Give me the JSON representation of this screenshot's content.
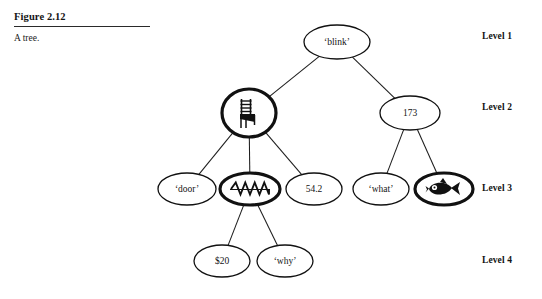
{
  "figure": {
    "number": "Figure 2.12",
    "caption": "A tree."
  },
  "levels": [
    {
      "label": "Level 1",
      "x": 482,
      "y": 31
    },
    {
      "label": "Level 2",
      "x": 482,
      "y": 102
    },
    {
      "label": "Level 3",
      "x": 482,
      "y": 183
    },
    {
      "label": "Level 4",
      "x": 482,
      "y": 255
    }
  ],
  "tree": {
    "nodes": [
      {
        "id": "blink",
        "label": "‘blink’",
        "kind": "text",
        "level": 1,
        "cx": 337,
        "cy": 42,
        "rx": 33,
        "ry": 17,
        "thick": false
      },
      {
        "id": "chair",
        "label": "",
        "kind": "chair",
        "level": 2,
        "cx": 249,
        "cy": 113,
        "rx": 27,
        "ry": 24,
        "thick": true
      },
      {
        "id": "173",
        "label": "173",
        "kind": "text",
        "level": 2,
        "cx": 410,
        "cy": 113,
        "rx": 30,
        "ry": 17,
        "thick": false
      },
      {
        "id": "door",
        "label": "‘door’",
        "kind": "text",
        "level": 3,
        "cx": 187,
        "cy": 189,
        "rx": 29,
        "ry": 16,
        "thick": false
      },
      {
        "id": "zigzag",
        "label": "",
        "kind": "zigzag",
        "level": 3,
        "cx": 250,
        "cy": 189,
        "rx": 30,
        "ry": 16,
        "thick": true
      },
      {
        "id": "542",
        "label": "54.2",
        "kind": "text",
        "level": 3,
        "cx": 314,
        "cy": 189,
        "rx": 28,
        "ry": 16,
        "thick": false
      },
      {
        "id": "what",
        "label": "‘what’",
        "kind": "text",
        "level": 3,
        "cx": 381,
        "cy": 189,
        "rx": 28,
        "ry": 16,
        "thick": false
      },
      {
        "id": "fish",
        "label": "",
        "kind": "fish",
        "level": 3,
        "cx": 444,
        "cy": 189,
        "rx": 29,
        "ry": 16,
        "thick": true
      },
      {
        "id": "20",
        "label": "$20",
        "kind": "text",
        "level": 4,
        "cx": 222,
        "cy": 261,
        "rx": 28,
        "ry": 16,
        "thick": false
      },
      {
        "id": "why",
        "label": "‘why’",
        "kind": "text",
        "level": 4,
        "cx": 285,
        "cy": 261,
        "rx": 28,
        "ry": 16,
        "thick": false
      }
    ],
    "edges": [
      {
        "from": "blink",
        "to": "chair"
      },
      {
        "from": "blink",
        "to": "173"
      },
      {
        "from": "chair",
        "to": "door"
      },
      {
        "from": "chair",
        "to": "zigzag"
      },
      {
        "from": "chair",
        "to": "542"
      },
      {
        "from": "173",
        "to": "what"
      },
      {
        "from": "173",
        "to": "fish"
      },
      {
        "from": "zigzag",
        "to": "20"
      },
      {
        "from": "zigzag",
        "to": "why"
      }
    ]
  },
  "colors": {
    "ink": "#111111",
    "background": "#ffffff"
  }
}
